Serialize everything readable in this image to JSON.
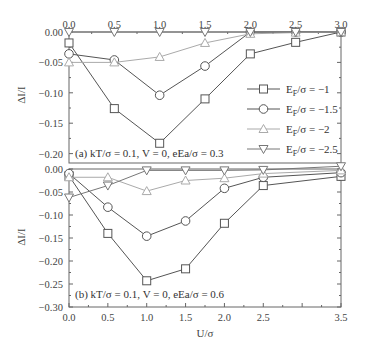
{
  "chart_data": [
    {
      "type": "line",
      "panel": "a",
      "annotation": "(a) kT/σ = 0.1, V = 0, eEa/σ = 0.3",
      "xlabel": "",
      "ylabel": "ΔI/I",
      "xlim": [
        0,
        3.0
      ],
      "ylim": [
        -0.22,
        0.0
      ],
      "x_ticks": [
        "0.0",
        "0.5",
        "1.0",
        "1.5",
        "2.0",
        "2.5",
        "3.0"
      ],
      "x_tick_position": "top",
      "y_ticks": [
        "0.00",
        "-0.05",
        "-0.10",
        "-0.15",
        "-0.20"
      ],
      "grid": false,
      "legend_position": "center-right",
      "x": [
        0,
        0.5,
        1.0,
        1.5,
        2.0,
        2.5,
        3.0
      ],
      "series": [
        {
          "name": "E_F/σ = -1",
          "marker": "square",
          "color": "#555555",
          "values": [
            -0.018,
            -0.126,
            -0.183,
            -0.11,
            -0.036,
            -0.017,
            0.0
          ]
        },
        {
          "name": "E_F/σ = -1.5",
          "marker": "circle",
          "color": "#555555",
          "values": [
            -0.036,
            -0.046,
            -0.104,
            -0.056,
            0.0,
            0.0,
            0.0
          ]
        },
        {
          "name": "E_F/σ = -2",
          "marker": "triangle-up",
          "color": "#aaaaaa",
          "values": [
            -0.05,
            -0.05,
            -0.041,
            -0.018,
            -0.003,
            -0.001,
            0.0
          ]
        },
        {
          "name": "E_F/σ = -2.5",
          "marker": "triangle-down",
          "color": "#777777",
          "values": [
            0.0,
            0.0,
            0.0,
            0.0,
            0.0,
            0.0,
            0.0
          ]
        }
      ]
    },
    {
      "type": "line",
      "panel": "b",
      "annotation": "(b) kT/σ = 0.1, V = 0, eEa/σ = 0.6",
      "xlabel": "U/σ",
      "ylabel": "ΔI/I",
      "xlim": [
        0,
        3.5
      ],
      "ylim": [
        -0.3,
        0.0
      ],
      "x_ticks": [
        "0.0",
        "0.5",
        "1.0",
        "1.5",
        "2.0",
        "2.5",
        "3.5"
      ],
      "x_tick_values": [
        0,
        0.5,
        1.0,
        1.5,
        2.0,
        2.5,
        3.5
      ],
      "x_tick_position": "bottom",
      "y_ticks": [
        "0.00",
        "-0.05",
        "-0.10",
        "-0.15",
        "-0.20",
        "-0.25",
        "-0.30"
      ],
      "grid": false,
      "x": [
        0,
        0.5,
        1.0,
        1.5,
        2.0,
        2.5,
        3.5
      ],
      "series": [
        {
          "name": "E_F/σ = -1",
          "marker": "square",
          "color": "#555555",
          "values": [
            -0.015,
            -0.14,
            -0.243,
            -0.217,
            -0.118,
            -0.036,
            -0.016
          ]
        },
        {
          "name": "E_F/σ = -1.5",
          "marker": "circle",
          "color": "#555555",
          "values": [
            -0.01,
            -0.083,
            -0.146,
            -0.113,
            -0.042,
            -0.018,
            -0.008
          ]
        },
        {
          "name": "E_F/σ = -2",
          "marker": "triangle-up",
          "color": "#aaaaaa",
          "values": [
            -0.018,
            -0.018,
            -0.048,
            -0.025,
            -0.02,
            -0.01,
            -0.003
          ]
        },
        {
          "name": "E_F/σ = -2.5",
          "marker": "triangle-down",
          "color": "#777777",
          "values": [
            -0.062,
            -0.036,
            -0.003,
            -0.003,
            -0.003,
            -0.002,
            0.006
          ]
        }
      ]
    }
  ],
  "legend": [
    {
      "label": "E_F/σ = −1",
      "main": "E",
      "sub": "F",
      "rest": "/σ = −1",
      "marker": "square",
      "color": "#555555"
    },
    {
      "label": "E_F/σ = −1.5",
      "main": "E",
      "sub": "F",
      "rest": "/σ = −1.5",
      "marker": "circle",
      "color": "#555555"
    },
    {
      "label": "E_F/σ = −2",
      "main": "E",
      "sub": "F",
      "rest": "/σ = −2",
      "marker": "triangle-up",
      "color": "#aaaaaa"
    },
    {
      "label": "E_F/σ = −2.5",
      "main": "E",
      "sub": "F",
      "rest": "/σ = −2.5",
      "marker": "triangle-down",
      "color": "#777777"
    }
  ],
  "labels": {
    "top_x_ticks": [
      "0.0",
      "0.5",
      "1.0",
      "1.5",
      "2.0",
      "2.5",
      "3.0"
    ],
    "top_y_ticks": [
      "0.00",
      "−0.05",
      "−0.10",
      "−0.15",
      "−0.20"
    ],
    "bottom_x_ticks": [
      "0.0",
      "0.5",
      "1.0",
      "1.5",
      "2.0",
      "2.5",
      "3.5"
    ],
    "bottom_y_ticks": [
      "0.00",
      "−0.05",
      "−0.10",
      "−0.15",
      "−0.20",
      "−0.25",
      "−0.30"
    ],
    "ylabel_top": "ΔI/I",
    "ylabel_bottom": "ΔI/I",
    "xlabel_bottom": "U/σ",
    "annot_a": "(a) kT/σ = 0.1, V = 0, eEa/σ = 0.3",
    "annot_b": "(b) kT/σ = 0.1, V = 0, eEa/σ = 0.6"
  }
}
